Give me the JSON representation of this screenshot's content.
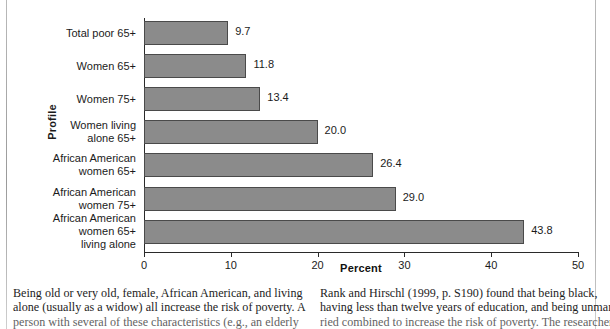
{
  "figure": {
    "y_axis_title": "Profile",
    "x_axis_title": "Percent"
  },
  "chart_data": {
    "type": "bar",
    "orientation": "horizontal",
    "title": "",
    "xlabel": "Percent",
    "ylabel": "Profile",
    "xlim": [
      0,
      50
    ],
    "xticks": [
      "0",
      "10",
      "20",
      "30",
      "40",
      "50"
    ],
    "grid": false,
    "legend": "none",
    "bar_color": "#8b8b8b",
    "bar_border_color": "#4a4a4a",
    "categories": [
      "Total poor 65+",
      "Women 65+",
      "Women 75+",
      "Women living\nalone 65+",
      "African American\nwomen 65+",
      "African American\nwomen 75+",
      "African American\nwomen 65+\nliving alone"
    ],
    "values": [
      9.7,
      11.8,
      13.4,
      20.0,
      26.4,
      29.0,
      43.8
    ],
    "value_labels": [
      "9.7",
      "11.8",
      "13.4",
      "20.0",
      "26.4",
      "29.0",
      "43.8"
    ]
  },
  "body_text": {
    "left_column": [
      "Being old or very old, female, African American, and living",
      "alone (usually as a widow) all increase the risk of poverty. A",
      "person with several of these characteristics (e.g., an elderly"
    ],
    "right_column": [
      "Rank and Hirschl (1999, p. S190) found that being black,",
      "having less than twelve years of education, and being unmar-",
      "ried combined to increase the risk of poverty. The researchers"
    ]
  }
}
